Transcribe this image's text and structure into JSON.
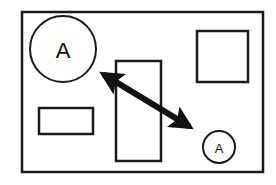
{
  "diagram": {
    "colors": {
      "stroke": "#1a1a1a",
      "background": "#ffffff"
    },
    "frame": {
      "x": 22,
      "y": 12,
      "w": 241,
      "h": 160
    },
    "rects": [
      {
        "name": "square-top-right",
        "x": 197,
        "y": 31,
        "w": 51,
        "h": 51
      },
      {
        "name": "tall-rect-center",
        "x": 116,
        "y": 61,
        "w": 45,
        "h": 100
      },
      {
        "name": "small-rect-left",
        "x": 39,
        "y": 108,
        "w": 54,
        "h": 26
      }
    ],
    "nodes": [
      {
        "name": "large-circle",
        "label": "A",
        "cx": 63,
        "cy": 49,
        "r": 33,
        "font_size": 22
      },
      {
        "name": "small-circle",
        "label": "A",
        "cx": 219,
        "cy": 147,
        "r": 16,
        "font_size": 13
      }
    ],
    "arrow": {
      "from": [
        88,
        65
      ],
      "to": [
        205,
        136
      ],
      "width": 6,
      "heads": "both"
    }
  }
}
